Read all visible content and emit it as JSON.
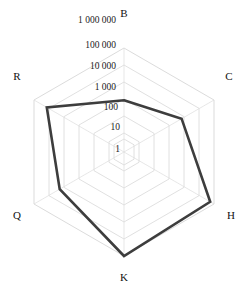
{
  "chart_data": {
    "type": "radar",
    "title": "",
    "subtitle": "",
    "xlabel": "",
    "ylabel": "",
    "scale": "log",
    "grid": true,
    "legend_position": "none",
    "categories": [
      "B",
      "C",
      "H",
      "K",
      "Q",
      "R"
    ],
    "tick_labels": [
      "1",
      "10",
      "100",
      "1 000",
      "10 000",
      "100 000",
      "1 000 000"
    ],
    "tick_values": [
      1,
      10,
      100,
      1000,
      10000,
      100000,
      1000000
    ],
    "rlim": [
      1,
      1000000
    ],
    "series": [
      {
        "name": "series-1",
        "color": "#3d3d3d",
        "values": [
          300,
          3000,
          500000,
          1000000,
          10000,
          100000
        ]
      }
    ],
    "annotations": []
  },
  "axes": {
    "labels": [
      {
        "key": "B",
        "text": "B"
      },
      {
        "key": "C",
        "text": "C"
      },
      {
        "key": "H",
        "text": "H"
      },
      {
        "key": "K",
        "text": "K"
      },
      {
        "key": "Q",
        "text": "Q"
      },
      {
        "key": "R",
        "text": "R"
      }
    ]
  },
  "ticks": {
    "items": [
      {
        "text": "1 000 000"
      },
      {
        "text": "100 000"
      },
      {
        "text": "10 000"
      },
      {
        "text": "1 000"
      },
      {
        "text": "100"
      },
      {
        "text": "10"
      },
      {
        "text": "1"
      }
    ]
  },
  "colors": {
    "series": "#3d3d3d",
    "grid": "#d8d8d8",
    "text": "#111111",
    "background": "#ffffff"
  }
}
